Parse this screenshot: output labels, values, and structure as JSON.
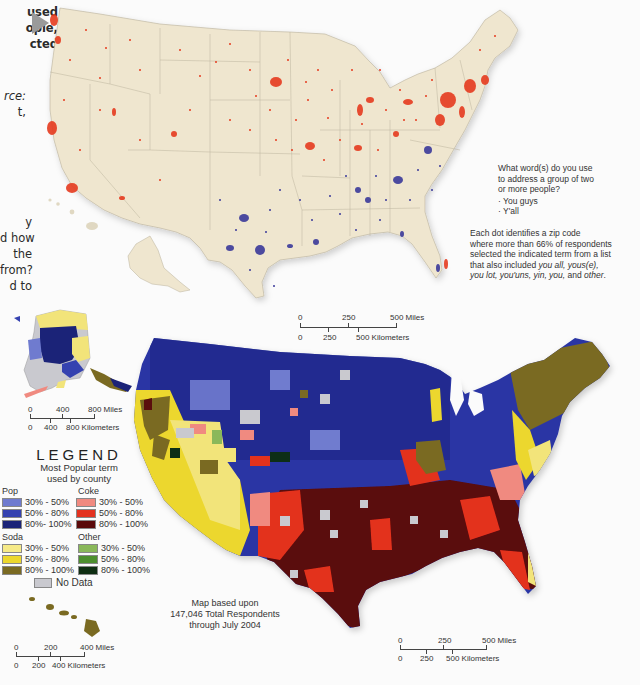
{
  "left_text": {
    "lines_top": [
      "used",
      "ople,",
      "cted"
    ],
    "lines_mid": [
      "rce:",
      "t,"
    ],
    "lines_bottom": [
      "y",
      "d how",
      "the",
      "from?",
      "d to"
    ]
  },
  "top_map": {
    "title": "What word(s) do you use to address a group of two or more people?",
    "question_lines": [
      "What word(s) do you use",
      "to address a group of two",
      "or more people?"
    ],
    "options": [
      "· You guys",
      "· Y'all"
    ],
    "dot_colors": {
      "you_guys": "#e63b1f",
      "yall": "#3b3a9a"
    },
    "note_lines": [
      "Each dot identifies a zip code",
      "where more than 66% of respondents",
      "selected the indicated term from a list",
      "that also included"
    ],
    "note_italic_terms": "you all, yous(e),",
    "note_last_line_parts": [
      "you lot, you'uns, yin, you,",
      " and ",
      "other",
      "."
    ],
    "scale": {
      "miles_labels": [
        "0",
        "250",
        "500 Miles"
      ],
      "km_labels": [
        "0",
        "250",
        "500 Kilometers"
      ]
    },
    "land_color": "#efe6cf"
  },
  "bottom_map": {
    "alaska_scale": {
      "miles_labels": [
        "0",
        "400",
        "800 Miles"
      ],
      "km_labels": [
        "0",
        "400",
        "800 Kilometers"
      ]
    },
    "hawaii_scale": {
      "miles_labels": [
        "0",
        "200",
        "400 Miles"
      ],
      "km_labels": [
        "0",
        "200",
        "400 Kilometers"
      ]
    },
    "main_scale": {
      "miles_labels": [
        "0",
        "250",
        "500 Miles"
      ],
      "km_labels": [
        "0",
        "250",
        "500 Kilometers"
      ]
    },
    "credit_lines": [
      "Map based upon",
      "147,046 Total Respondents",
      "through July 2004"
    ]
  },
  "legend": {
    "title": "LEGEND",
    "subtitle_lines": [
      "Most Popular term",
      "used by county"
    ],
    "groups": [
      {
        "name": "Pop",
        "items": [
          {
            "label": "30% - 50%",
            "color": "#6f7bcf"
          },
          {
            "label": "50% - 80%",
            "color": "#3542b0"
          },
          {
            "label": "80%- 100%",
            "color": "#1b2378"
          }
        ]
      },
      {
        "name": "Coke",
        "items": [
          {
            "label": "30% - 50%",
            "color": "#f08a80"
          },
          {
            "label": "50% - 80%",
            "color": "#e3321f"
          },
          {
            "label": "80% - 100%",
            "color": "#5a0a0a"
          }
        ]
      },
      {
        "name": "Soda",
        "items": [
          {
            "label": "30% - 50%",
            "color": "#f6ea88"
          },
          {
            "label": "50% - 80%",
            "color": "#ecd72d"
          },
          {
            "label": "80% - 100%",
            "color": "#7a6a22"
          }
        ]
      },
      {
        "name": "Other",
        "items": [
          {
            "label": "30% - 50%",
            "color": "#8ab85a"
          },
          {
            "label": "50% - 80%",
            "color": "#4d8f2e"
          },
          {
            "label": "80% - 100%",
            "color": "#0f2e12"
          }
        ]
      }
    ],
    "no_data": {
      "label": "No Data",
      "color": "#c9c9cf"
    }
  }
}
